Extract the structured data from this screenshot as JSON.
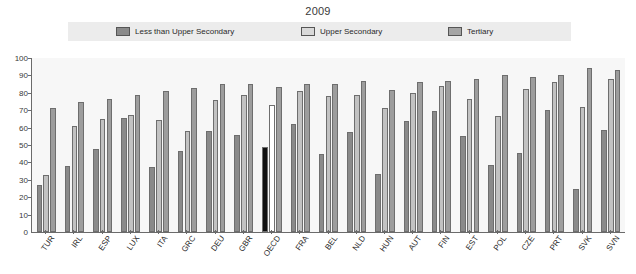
{
  "chart_data": {
    "type": "bar",
    "title": "2009",
    "xlabel": "",
    "ylabel": "",
    "ylim": [
      0,
      100
    ],
    "yticks": [
      0,
      10,
      20,
      30,
      40,
      50,
      60,
      70,
      80,
      90,
      100
    ],
    "grid": false,
    "legend_position": "top",
    "categories": [
      "TUR",
      "IRL",
      "ESP",
      "LUX",
      "ITA",
      "GRC",
      "DEU",
      "GBR",
      "OECD",
      "FRA",
      "BEL",
      "NLD",
      "HUN",
      "AUT",
      "FIN",
      "EST",
      "POL",
      "CZE",
      "PRT",
      "SVK",
      "SVN"
    ],
    "highlight_category": "OECD",
    "series": [
      {
        "name": "Less than Upper Secondary",
        "color": "#8a8a8a",
        "highlight_color": "#111111",
        "values": [
          27,
          38,
          47.5,
          65.5,
          37.5,
          46.5,
          58,
          56,
          49,
          62,
          45,
          57.5,
          33.5,
          64,
          69.5,
          55,
          38.5,
          45.5,
          70,
          24.5,
          58.5
        ]
      },
      {
        "name": "Upper Secondary",
        "color": "#c2c2c2",
        "highlight_color": "#ffffff",
        "values": [
          33,
          61,
          65,
          67,
          64.5,
          58,
          76,
          78.5,
          73,
          81,
          78,
          79,
          71,
          80,
          84,
          76.5,
          66.5,
          82,
          86.5,
          72,
          88
        ]
      },
      {
        "name": "Tertiary",
        "color": "#9d9d9d",
        "highlight_color": "#9d9d9d",
        "values": [
          71,
          74.5,
          76.5,
          79,
          81,
          83,
          85,
          85,
          83.5,
          85,
          85,
          87,
          81.5,
          86,
          87,
          88,
          90,
          89,
          90.5,
          94,
          93
        ]
      }
    ]
  },
  "axis": {
    "y_tick_labels": [
      "0",
      "10",
      "20",
      "30",
      "40",
      "50",
      "60",
      "70",
      "80",
      "90",
      "100"
    ]
  },
  "legend": {
    "items": [
      {
        "label": "Less than Upper Secondary",
        "swatch": "#8a8a8a"
      },
      {
        "label": "Upper Secondary",
        "swatch": "#d9d9d9"
      },
      {
        "label": "Tertiary",
        "swatch": "#a5a5a5"
      }
    ]
  }
}
